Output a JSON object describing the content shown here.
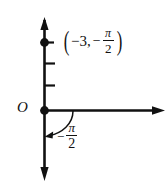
{
  "figure": {
    "background_color": "#ffffff",
    "stroke_color": "#111111",
    "width": 168,
    "height": 186
  },
  "axes": {
    "origin_label": "O",
    "vertical_axis": {
      "name": "vertical-axis",
      "x": 44,
      "y_top": 18,
      "y_bottom": 180,
      "arrow_top": true,
      "arrow_bottom": true
    },
    "horizontal_axis": {
      "name": "horizontal-axis",
      "y": 110,
      "x_left": 44,
      "x_right": 165,
      "arrow_right": true
    },
    "ticks": [
      {
        "name": "tick-1",
        "y": 42,
        "length": 8
      },
      {
        "name": "tick-2",
        "y": 63,
        "length": 8
      },
      {
        "name": "tick-3",
        "y": 85,
        "length": 8
      }
    ]
  },
  "points": [
    {
      "name": "plotted-point",
      "x": 44,
      "y": 42,
      "radius": 4.2,
      "filled": true
    },
    {
      "name": "origin-point",
      "x": 44,
      "y": 110,
      "radius": 4.2,
      "filled": true
    }
  ],
  "point_label": {
    "open_paren": "(",
    "coord_x": "−3",
    "comma": ",",
    "negative_sign": "−",
    "numerator": "π",
    "denominator": "2",
    "close_paren": ")",
    "full_text": "(−3, −π/2)"
  },
  "angle_label": {
    "negative_sign": "−",
    "numerator": "π",
    "denominator": "2",
    "full_text": "−π/2"
  },
  "angle_arc": {
    "name": "angle-arc-arrow",
    "start_x": 72,
    "start_y": 110,
    "end_x": 47,
    "end_y": 136,
    "direction": "clockwise-from-positive-x-axis-downward",
    "has_arrowhead": true
  }
}
